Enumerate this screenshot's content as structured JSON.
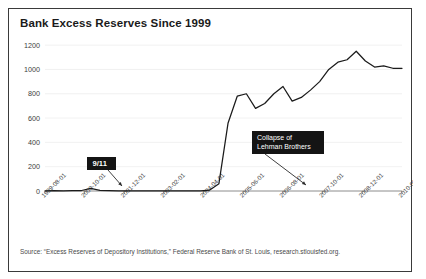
{
  "chart_data": {
    "type": "line",
    "title": "Bank Excess Reserves Since 1999",
    "xlabel": "",
    "ylabel": "",
    "ylim": [
      0,
      1300
    ],
    "yticks": [
      0,
      200,
      400,
      600,
      800,
      1000,
      1200
    ],
    "ytick_labels": [
      "0",
      "200",
      "400",
      "600",
      "800",
      "1000",
      "1200"
    ],
    "xtick_labels": [
      "1999-08-01",
      "2000-10-01",
      "2001-12-01",
      "2003-02-01",
      "2004-04-01",
      "2005-06-01",
      "2006-08-01",
      "2007-10-01",
      "2008-12-01",
      "2010-02-01"
    ],
    "grid": true,
    "legend": "none",
    "line_color": "#1b1b1b",
    "series": [
      {
        "name": "Excess Reserves of Depository Institutions",
        "x": [
          "1999-08-01",
          "2000-02-01",
          "2000-10-01",
          "2001-04-01",
          "2001-09-01",
          "2001-10-01",
          "2001-12-01",
          "2002-06-01",
          "2003-02-01",
          "2003-10-01",
          "2004-04-01",
          "2004-12-01",
          "2005-06-01",
          "2006-02-01",
          "2006-08-01",
          "2007-04-01",
          "2007-10-01",
          "2008-06-01",
          "2008-09-01",
          "2008-10-01",
          "2008-11-01",
          "2008-12-01",
          "2009-01-01",
          "2009-02-01",
          "2009-03-01",
          "2009-04-01",
          "2009-05-01",
          "2009-06-01",
          "2009-07-01",
          "2009-08-01",
          "2009-09-01",
          "2009-10-01",
          "2009-11-01",
          "2009-12-01",
          "2010-01-01",
          "2010-02-01",
          "2010-04-01",
          "2010-06-01",
          "2010-08-01",
          "2010-10-01"
        ],
        "values": [
          2,
          3,
          2,
          3,
          4,
          22,
          5,
          3,
          2,
          2,
          2,
          2,
          2,
          2,
          2,
          2,
          2,
          2,
          8,
          60,
          560,
          780,
          800,
          680,
          720,
          800,
          860,
          740,
          770,
          830,
          900,
          1000,
          1060,
          1080,
          1150,
          1070,
          1020,
          1030,
          1010,
          1010
        ]
      }
    ],
    "annotations": [
      {
        "id": "nine-eleven",
        "label": "9/11",
        "lines": [
          "9/11"
        ],
        "points_to": "2001-10-01"
      },
      {
        "id": "lehman",
        "label": "Collapse of Lehman Brothers",
        "lines": [
          "Collapse of",
          "Lehman Brothers"
        ],
        "points_to": "2008-10-01"
      }
    ]
  },
  "source": {
    "note": "Source: “Excess Reserves of Depository Institutions,” Federal Reserve Bank of St. Louis, research.stlouisfed.org."
  }
}
